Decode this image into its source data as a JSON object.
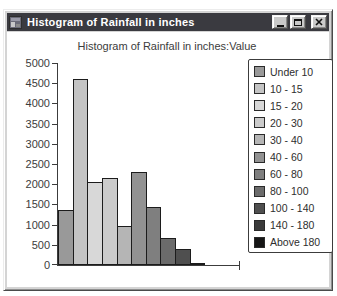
{
  "window": {
    "title": "Histogram of Rainfall in inches",
    "icons": {
      "app": "application-icon",
      "minimize": "minimize-icon",
      "maximize": "maximize-icon",
      "close": "close-icon"
    }
  },
  "colors": {
    "titlebar": "#3a3a40",
    "titlebar_text": "#ffffff",
    "window_frame": "#d4d4d4",
    "client_bg": "#ffffff",
    "axis_and_text": "#3c3c3c",
    "bar_border": "#1c1c1c",
    "legend_border": "#3c3c3c"
  },
  "chart_data": {
    "type": "bar",
    "title": "Histogram of Rainfall in inches:Value",
    "categories": [
      "Under 10",
      "10 - 15",
      "15 - 20",
      "20 - 30",
      "30 - 40",
      "40 - 60",
      "60 - 80",
      "80 - 100",
      "100 - 140",
      "140 - 180",
      "Above 180"
    ],
    "values": [
      1350,
      4600,
      2050,
      2150,
      975,
      2300,
      1425,
      660,
      400,
      60,
      0
    ],
    "colors": [
      "#999999",
      "#c4c4c4",
      "#d8d8d8",
      "#cbcbcb",
      "#b5b5b5",
      "#929292",
      "#7f7f7f",
      "#6b6b6b",
      "#4f4f4f",
      "#3a3a3a",
      "#161616"
    ],
    "xlabel": "",
    "ylabel": "",
    "ylim": [
      0,
      5000
    ],
    "yticks": [
      5000,
      4500,
      4000,
      3500,
      3000,
      2500,
      2000,
      1500,
      1000,
      500,
      0
    ],
    "grid": false,
    "legend_position": "right"
  }
}
